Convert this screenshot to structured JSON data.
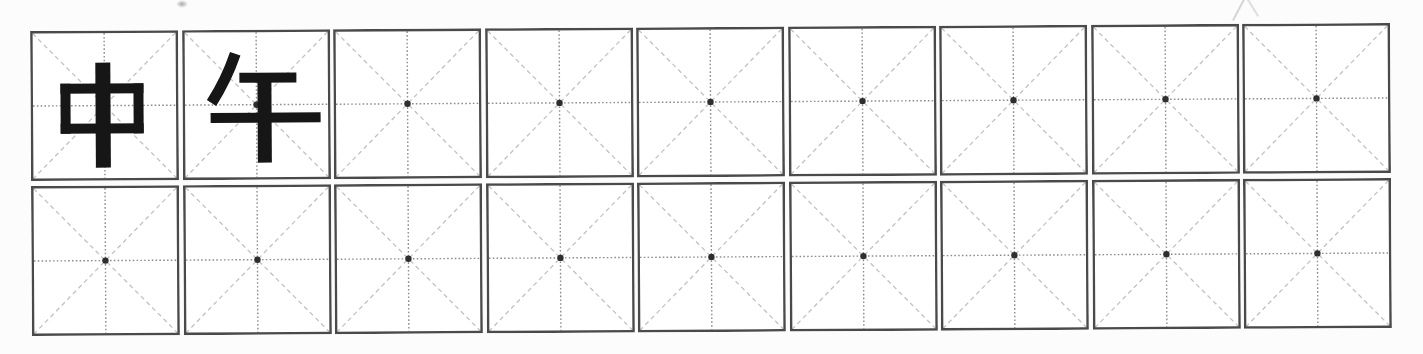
{
  "page": {
    "background_color": "#fcfcfc"
  },
  "practice_sheet": {
    "word": "中午",
    "grid_type": "mi-zi-ge",
    "rows": [
      {
        "cells": [
          "中",
          "午",
          "",
          "",
          "",
          "",
          "",
          "",
          ""
        ]
      },
      {
        "cells": [
          "",
          "",
          "",
          "",
          "",
          "",
          "",
          "",
          ""
        ]
      }
    ],
    "style": {
      "cell_background": "#ffffff",
      "border_color": "#4a4a4a",
      "midline_color": "#8d8d8d",
      "diagonal_color": "#c2c2c2",
      "center_dot_color": "#2e2e2e",
      "character_color": "#161616"
    }
  }
}
